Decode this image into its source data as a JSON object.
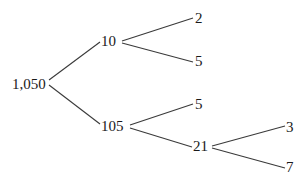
{
  "diagram": {
    "type": "factor-tree",
    "nodes": {
      "root": {
        "label": "1,050",
        "x": 12,
        "y": 89
      },
      "n10": {
        "label": "10",
        "x": 101,
        "y": 46
      },
      "n105": {
        "label": "105",
        "x": 101,
        "y": 131
      },
      "n2": {
        "label": "2",
        "x": 195,
        "y": 23
      },
      "n5a": {
        "label": "5",
        "x": 195,
        "y": 66
      },
      "n5b": {
        "label": "5",
        "x": 195,
        "y": 109
      },
      "n21": {
        "label": "21",
        "x": 193,
        "y": 151
      },
      "n3": {
        "label": "3",
        "x": 286,
        "y": 132
      },
      "n7": {
        "label": "7",
        "x": 286,
        "y": 172
      }
    },
    "edges": [
      {
        "from": "root",
        "to": "n10",
        "x1": 49,
        "y1": 80,
        "x2": 100,
        "y2": 42
      },
      {
        "from": "root",
        "to": "n105",
        "x1": 49,
        "y1": 85,
        "x2": 100,
        "y2": 124
      },
      {
        "from": "n10",
        "to": "n2",
        "x1": 122,
        "y1": 41,
        "x2": 193,
        "y2": 18
      },
      {
        "from": "n10",
        "to": "n5a",
        "x1": 122,
        "y1": 43,
        "x2": 193,
        "y2": 62
      },
      {
        "from": "n105",
        "to": "n5b",
        "x1": 130,
        "y1": 125,
        "x2": 193,
        "y2": 104
      },
      {
        "from": "n105",
        "to": "n21",
        "x1": 130,
        "y1": 128,
        "x2": 192,
        "y2": 147
      },
      {
        "from": "n21",
        "to": "n3",
        "x1": 212,
        "y1": 146,
        "x2": 285,
        "y2": 126
      },
      {
        "from": "n21",
        "to": "n7",
        "x1": 212,
        "y1": 148,
        "x2": 285,
        "y2": 168
      }
    ]
  }
}
